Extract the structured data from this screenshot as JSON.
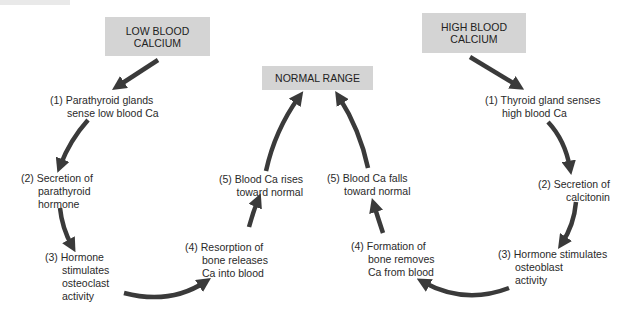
{
  "diagram": {
    "type": "feedback-loop",
    "boxes": {
      "low": {
        "line1": "LOW BLOOD",
        "line2": "CALCIUM"
      },
      "high": {
        "line1": "HIGH BLOOD",
        "line2": "CALCIUM"
      },
      "normal": {
        "text": "NORMAL RANGE"
      }
    },
    "left_loop": [
      {
        "num": "(1)",
        "l1": "Parathyroid glands",
        "l2": "sense low blood Ca"
      },
      {
        "num": "(2)",
        "l1": "Secretion of",
        "l2": "parathyroid",
        "l3": "hormone"
      },
      {
        "num": "(3)",
        "l1": "Hormone",
        "l2": "stimulates",
        "l3": "osteoclast",
        "l4": "activity"
      },
      {
        "num": "(4)",
        "l1": "Resorption of",
        "l2": "bone releases",
        "l3": "Ca into blood"
      },
      {
        "num": "(5)",
        "l1": "Blood Ca rises",
        "l2": "toward normal"
      }
    ],
    "right_loop": [
      {
        "num": "(1)",
        "l1": "Thyroid gland senses",
        "l2": "high blood Ca"
      },
      {
        "num": "(2)",
        "l1": "Secretion of",
        "l2": "calcitonin"
      },
      {
        "num": "(3)",
        "l1": "Hormone stimulates",
        "l2": "osteoblast",
        "l3": "activity"
      },
      {
        "num": "(4)",
        "l1": "Formation of",
        "l2": "bone removes",
        "l3": "Ca from blood"
      },
      {
        "num": "(5)",
        "l1": "Blood Ca falls",
        "l2": "toward normal"
      }
    ],
    "colors": {
      "box": "#d4d4d4",
      "arrow": "#3a3a3a",
      "text": "#2a2a2a"
    }
  }
}
